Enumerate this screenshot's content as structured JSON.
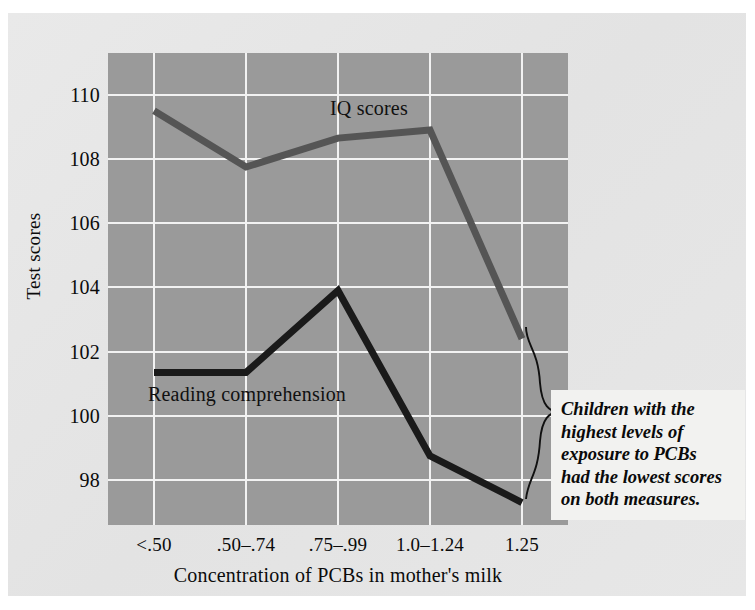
{
  "figure": {
    "y_axis_title": "Test scores",
    "x_axis_title": "Concentration of PCBs in mother's milk",
    "annotation": "Children with the\nhighest levels of\nexposure to PCBs\nhad the lowest scores\non both measures.",
    "colors": {
      "plot_background": "#9a9a9a",
      "card_background": "#e6e6e6",
      "gridline": "#f2f2f2",
      "iq_line": "#555555",
      "reading_line": "#1a1a1a",
      "annotation_background": "#f2f2f0",
      "text": "#0b0b0b"
    }
  },
  "chart_data": {
    "type": "line",
    "title": "",
    "xlabel": "Concentration of PCBs in mother's milk",
    "ylabel": "Test scores",
    "categories": [
      "<.50",
      ".50–.74",
      ".75–.99",
      "1.0–1.24",
      "1.25"
    ],
    "yticks": [
      98,
      100,
      102,
      104,
      106,
      108,
      110
    ],
    "ylim": [
      96.6,
      111.3
    ],
    "grid": true,
    "legend_position": "inline-labels",
    "series": [
      {
        "name": "IQ scores",
        "color": "#555555",
        "values": [
          109.5,
          107.75,
          108.65,
          108.9,
          102.4
        ]
      },
      {
        "name": "Reading comprehension",
        "color": "#1a1a1a",
        "values": [
          101.35,
          101.35,
          103.9,
          98.75,
          97.3
        ]
      }
    ],
    "annotations": [
      {
        "text": "Children with the highest levels of exposure to PCBs had the lowest scores on both measures.",
        "points_to": [
          "IQ scores at 1.25",
          "Reading comprehension at 1.25"
        ]
      }
    ]
  }
}
